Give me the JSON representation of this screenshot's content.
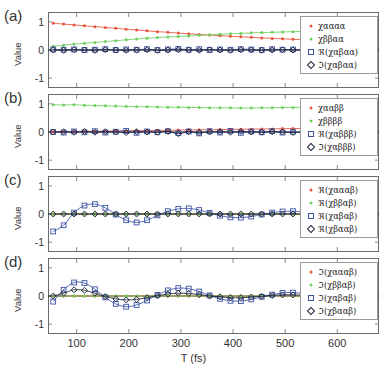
{
  "figure": {
    "xlabel": "T (fs)",
    "ylabel": "Value",
    "xticks": [
      "100",
      "200",
      "300",
      "400",
      "500",
      "600"
    ],
    "xtickvals": [
      100,
      200,
      300,
      400,
      500,
      600
    ],
    "yticks": [
      "1",
      "0",
      "-1"
    ],
    "ytickvals": [
      1,
      0,
      -1
    ],
    "xlim": [
      45,
      680
    ],
    "ylim": [
      -1.35,
      1.35
    ],
    "colors": {
      "red": "#e8553c",
      "green": "#6fcf5f",
      "blue": "#3a53a4",
      "dark": "#23233c",
      "axis": "#6b6b6b",
      "zero_line": "#000000"
    },
    "panels": [
      {
        "label": "(a)",
        "legend": [
          {
            "text": "χαααα",
            "marker": "dot",
            "color": "#e8553c"
          },
          {
            "text": "χββαα",
            "marker": "dot",
            "color": "#6fcf5f"
          },
          {
            "text": "ℜ(χαβαα)",
            "marker": "square",
            "color": "#3a53a4"
          },
          {
            "text": "ℑ(χαβαα)",
            "marker": "diamond",
            "color": "#23233c"
          }
        ]
      },
      {
        "label": "(b)",
        "legend": [
          {
            "text": "χααββ",
            "marker": "dot",
            "color": "#e8553c"
          },
          {
            "text": "χββββ",
            "marker": "dot",
            "color": "#6fcf5f"
          },
          {
            "text": "ℜ(χαβββ)",
            "marker": "square",
            "color": "#3a53a4"
          },
          {
            "text": "ℑ(χαβββ)",
            "marker": "diamond",
            "color": "#23233c"
          }
        ]
      },
      {
        "label": "(c)",
        "legend": [
          {
            "text": "ℜ(χαααβ)",
            "marker": "dot",
            "color": "#e8553c"
          },
          {
            "text": "ℜ(χββαβ)",
            "marker": "dot",
            "color": "#6fcf5f"
          },
          {
            "text": "ℜ(χαβαβ)",
            "marker": "square",
            "color": "#3a53a4"
          },
          {
            "text": "ℜ(χβααβ)",
            "marker": "diamond",
            "color": "#23233c"
          }
        ]
      },
      {
        "label": "(d)",
        "legend": [
          {
            "text": "ℑ(χαααβ)",
            "marker": "dot",
            "color": "#e8553c"
          },
          {
            "text": "ℑ(χββαβ)",
            "marker": "dot",
            "color": "#6fcf5f"
          },
          {
            "text": "ℑ(χαβαβ)",
            "marker": "square",
            "color": "#3a53a4"
          },
          {
            "text": "ℑ(χβααβ)",
            "marker": "diamond",
            "color": "#23233c"
          }
        ]
      }
    ]
  },
  "chart_data": [
    {
      "type": "line",
      "panel": "(a)",
      "title": "",
      "xlabel": "",
      "ylabel": "Value",
      "xlim": [
        45,
        680
      ],
      "ylim": [
        -1.35,
        1.35
      ],
      "grid": false,
      "legend_position": "top-right",
      "x": [
        55,
        75,
        95,
        115,
        135,
        155,
        175,
        195,
        215,
        235,
        255,
        275,
        295,
        315,
        335,
        355,
        375,
        395,
        415,
        435,
        455,
        475,
        495,
        515,
        535,
        555,
        570
      ],
      "series": [
        {
          "name": "χαααα",
          "marker": "dot",
          "color": "#e8553c",
          "values": [
            0.95,
            0.92,
            0.89,
            0.86,
            0.83,
            0.8,
            0.77,
            0.74,
            0.71,
            0.68,
            0.65,
            0.63,
            0.6,
            0.58,
            0.55,
            0.53,
            0.51,
            0.49,
            0.47,
            0.45,
            0.43,
            0.41,
            0.4,
            0.38,
            0.36,
            0.34,
            0.33
          ]
        },
        {
          "name": "χββαα",
          "marker": "dot",
          "color": "#6fcf5f",
          "values": [
            0.13,
            0.17,
            0.21,
            0.24,
            0.27,
            0.3,
            0.33,
            0.36,
            0.39,
            0.42,
            0.44,
            0.46,
            0.48,
            0.5,
            0.52,
            0.54,
            0.56,
            0.58,
            0.59,
            0.61,
            0.62,
            0.63,
            0.64,
            0.65,
            0.66,
            0.67,
            0.68
          ]
        },
        {
          "name": "ℜ(χαβαα)",
          "marker": "square",
          "color": "#3a53a4",
          "values": [
            0.02,
            0.01,
            0.02,
            0.0,
            0.01,
            0.03,
            0.0,
            0.02,
            0.01,
            0.03,
            0.0,
            0.02,
            0.04,
            0.01,
            0.03,
            0.0,
            0.02,
            0.01,
            0.03,
            0.02,
            0.0,
            0.03,
            0.01,
            0.02,
            0.0,
            0.03,
            0.01
          ]
        },
        {
          "name": "ℑ(χαβαα)",
          "marker": "diamond",
          "color": "#23233c",
          "values": [
            0.0,
            -0.01,
            0.01,
            0.0,
            -0.01,
            0.01,
            0.0,
            -0.01,
            0.0,
            0.01,
            -0.01,
            0.0,
            0.01,
            0.0,
            -0.01,
            0.01,
            0.0,
            -0.01,
            0.01,
            0.0,
            -0.01,
            0.0,
            0.01,
            0.0,
            -0.01,
            0.0,
            0.01
          ]
        }
      ]
    },
    {
      "type": "line",
      "panel": "(b)",
      "title": "",
      "xlabel": "",
      "ylabel": "Value",
      "xlim": [
        45,
        680
      ],
      "ylim": [
        -1.35,
        1.35
      ],
      "grid": false,
      "legend_position": "top-right",
      "x": [
        55,
        75,
        95,
        115,
        135,
        155,
        175,
        195,
        215,
        235,
        255,
        275,
        295,
        315,
        335,
        355,
        375,
        395,
        415,
        435,
        455,
        475,
        495,
        515,
        535,
        555,
        570
      ],
      "series": [
        {
          "name": "χααββ",
          "marker": "dot",
          "color": "#e8553c",
          "values": [
            0.01,
            0.01,
            0.02,
            0.02,
            0.03,
            0.03,
            0.04,
            0.04,
            0.05,
            0.05,
            0.06,
            0.06,
            0.07,
            0.07,
            0.08,
            0.08,
            0.09,
            0.09,
            0.1,
            0.1,
            0.11,
            0.11,
            0.12,
            0.12,
            0.13,
            0.13,
            0.14
          ]
        },
        {
          "name": "χββββ",
          "marker": "dot",
          "color": "#6fcf5f",
          "values": [
            0.97,
            0.96,
            0.97,
            0.95,
            0.94,
            0.93,
            0.92,
            0.91,
            0.9,
            0.9,
            0.89,
            0.88,
            0.88,
            0.87,
            0.87,
            0.86,
            0.86,
            0.86,
            0.85,
            0.85,
            0.86,
            0.86,
            0.87,
            0.87,
            0.88,
            0.88,
            0.89
          ]
        },
        {
          "name": "ℜ(χαβββ)",
          "marker": "square",
          "color": "#3a53a4",
          "values": [
            0.0,
            -0.02,
            0.02,
            -0.01,
            0.03,
            -0.02,
            0.01,
            0.04,
            -0.03,
            0.02,
            -0.01,
            0.03,
            -0.04,
            0.02,
            -0.05,
            0.03,
            -0.02,
            0.04,
            -0.03,
            0.02,
            -0.01,
            0.03,
            -0.02,
            0.01,
            -0.03,
            0.02,
            -0.01
          ]
        },
        {
          "name": "ℑ(χαβββ)",
          "marker": "diamond",
          "color": "#23233c",
          "values": [
            0.0,
            0.01,
            -0.01,
            0.02,
            -0.01,
            0.01,
            0.0,
            -0.02,
            0.01,
            0.0,
            -0.01,
            0.02,
            -0.06,
            0.01,
            -0.02,
            0.0,
            0.01,
            -0.01,
            0.02,
            0.0,
            -0.01,
            0.01,
            0.0,
            -0.02,
            0.01,
            0.0,
            -0.01
          ]
        }
      ]
    },
    {
      "type": "line",
      "panel": "(c)",
      "title": "",
      "xlabel": "",
      "ylabel": "Value",
      "xlim": [
        45,
        680
      ],
      "ylim": [
        -1.35,
        1.35
      ],
      "grid": false,
      "legend_position": "top-right",
      "x": [
        55,
        75,
        95,
        115,
        135,
        155,
        175,
        195,
        215,
        235,
        255,
        275,
        295,
        315,
        335,
        355,
        375,
        395,
        415,
        435,
        455,
        475,
        495,
        515,
        535,
        555,
        570
      ],
      "series": [
        {
          "name": "ℜ(χαααβ)",
          "marker": "dot",
          "color": "#e8553c",
          "values": [
            0.0,
            0.0,
            0.0,
            0.0,
            0.0,
            0.0,
            0.0,
            0.0,
            0.0,
            0.0,
            0.0,
            0.0,
            0.0,
            0.0,
            0.0,
            0.0,
            0.0,
            0.0,
            0.0,
            0.0,
            0.0,
            0.0,
            0.0,
            0.0,
            0.0,
            0.0,
            0.0
          ]
        },
        {
          "name": "ℜ(χββαβ)",
          "marker": "dot",
          "color": "#6fcf5f",
          "values": [
            0.0,
            0.0,
            0.0,
            0.0,
            0.0,
            0.0,
            0.0,
            0.0,
            0.0,
            0.0,
            0.0,
            0.0,
            0.0,
            0.0,
            0.0,
            0.0,
            0.0,
            0.0,
            0.0,
            0.0,
            0.0,
            0.0,
            0.0,
            0.0,
            0.0,
            0.0,
            0.0
          ]
        },
        {
          "name": "ℜ(χαβαβ)",
          "marker": "square",
          "color": "#3a53a4",
          "values": [
            -0.62,
            -0.4,
            0.05,
            0.3,
            0.35,
            0.22,
            -0.02,
            -0.22,
            -0.3,
            -0.22,
            -0.05,
            0.1,
            0.18,
            0.2,
            0.14,
            0.04,
            -0.06,
            -0.12,
            -0.13,
            -0.09,
            -0.02,
            0.05,
            0.09,
            0.1,
            0.07,
            0.02,
            -0.02
          ]
        },
        {
          "name": "ℜ(χβααβ)",
          "marker": "diamond",
          "color": "#23233c",
          "values": [
            0.0,
            0.0,
            0.0,
            0.0,
            0.0,
            0.0,
            0.0,
            0.0,
            0.0,
            0.0,
            0.0,
            0.0,
            0.0,
            0.0,
            0.0,
            0.0,
            0.0,
            0.0,
            0.0,
            0.0,
            0.0,
            0.0,
            0.0,
            0.0,
            0.0,
            0.0,
            0.0
          ]
        }
      ]
    },
    {
      "type": "line",
      "panel": "(d)",
      "title": "",
      "xlabel": "T (fs)",
      "ylabel": "Value",
      "xlim": [
        45,
        680
      ],
      "ylim": [
        -1.35,
        1.35
      ],
      "grid": false,
      "legend_position": "top-right",
      "x": [
        55,
        75,
        95,
        115,
        135,
        155,
        175,
        195,
        215,
        235,
        255,
        275,
        295,
        315,
        335,
        355,
        375,
        395,
        415,
        435,
        455,
        475,
        495,
        515,
        535,
        555,
        570
      ],
      "series": [
        {
          "name": "ℑ(χαααβ)",
          "marker": "dot",
          "color": "#e8553c",
          "values": [
            0.0,
            0.0,
            0.0,
            0.0,
            0.0,
            0.0,
            0.0,
            0.0,
            0.0,
            0.0,
            0.0,
            0.0,
            0.0,
            0.0,
            0.0,
            0.0,
            0.0,
            0.0,
            0.0,
            0.0,
            0.0,
            0.0,
            0.0,
            0.0,
            0.0,
            0.0,
            0.0
          ]
        },
        {
          "name": "ℑ(χββαβ)",
          "marker": "dot",
          "color": "#6fcf5f",
          "values": [
            0.0,
            0.0,
            0.0,
            0.0,
            0.0,
            0.0,
            0.0,
            0.0,
            0.0,
            0.0,
            0.0,
            0.0,
            0.0,
            0.0,
            0.0,
            0.0,
            0.0,
            0.0,
            0.0,
            0.0,
            0.0,
            0.0,
            0.0,
            0.0,
            0.0,
            0.0,
            0.0
          ]
        },
        {
          "name": "ℑ(χαβαβ)",
          "marker": "square",
          "color": "#3a53a4",
          "values": [
            -0.2,
            0.22,
            0.48,
            0.46,
            0.24,
            -0.05,
            -0.28,
            -0.38,
            -0.32,
            -0.16,
            0.04,
            0.2,
            0.28,
            0.26,
            0.16,
            0.02,
            -0.1,
            -0.17,
            -0.18,
            -0.12,
            -0.03,
            0.05,
            0.11,
            0.12,
            0.09,
            0.03,
            -0.02
          ]
        },
        {
          "name": "ℑ(χβααβ)",
          "marker": "diamond",
          "color": "#23233c",
          "values": [
            0.0,
            0.1,
            0.22,
            0.2,
            0.1,
            -0.02,
            -0.1,
            -0.14,
            -0.12,
            -0.06,
            0.01,
            0.07,
            0.1,
            0.09,
            0.05,
            0.0,
            -0.03,
            -0.06,
            -0.06,
            -0.04,
            -0.01,
            0.02,
            0.04,
            0.04,
            0.03,
            0.01,
            -0.01
          ]
        }
      ]
    }
  ]
}
